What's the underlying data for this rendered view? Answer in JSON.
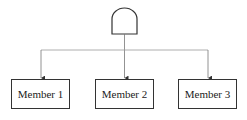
{
  "diagram": {
    "root": {
      "shape": "and-gate"
    },
    "members": [
      {
        "label": "Member 1"
      },
      {
        "label": "Member 2"
      },
      {
        "label": "Member 3"
      }
    ],
    "colors": {
      "stroke": "#333333",
      "connector": "#777777",
      "background": "#ffffff"
    }
  }
}
